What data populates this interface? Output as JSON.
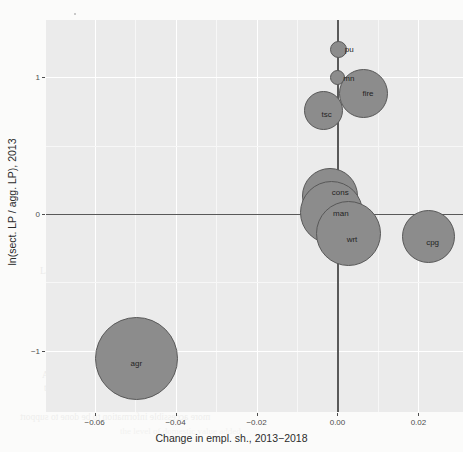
{
  "figure": {
    "background_color": "#fbfbfa",
    "panel_color": "#ebebeb",
    "bubble_fill": "#8c8c8c",
    "bubble_stroke": "#585858",
    "reference_line_color": "#595959"
  },
  "chart_data": {
    "type": "scatter",
    "title": "",
    "subtitle": "",
    "xlabel": "Change in empl. sh., 2013−2018",
    "ylabel": "ln(sect. LP / agg. LP), 2013",
    "xlim": [
      -0.072,
      0.031
    ],
    "ylim": [
      -1.45,
      1.42
    ],
    "xticks": [
      -0.06,
      -0.04,
      -0.02,
      0.0,
      0.02
    ],
    "xticklabels": [
      "−0.06",
      "−0.04",
      "−0.02",
      "0.00",
      "0.02"
    ],
    "yticks": [
      1,
      0,
      -1
    ],
    "yticklabels": [
      "1",
      "0",
      "−1"
    ],
    "grid": true,
    "legend": false,
    "reference_lines": {
      "x": 0,
      "y": 0
    },
    "size_encoding": "employment share",
    "points": [
      {
        "label": "pu",
        "x": 0.0002,
        "y": 1.205,
        "size_px": 8.5,
        "label_dx": 11,
        "label_dy": 0
      },
      {
        "label": "mn",
        "x": 0.0001,
        "y": 1.0,
        "size_px": 7.5,
        "label_dx": 11,
        "label_dy": 1
      },
      {
        "label": "fire",
        "x": 0.0063,
        "y": 0.885,
        "size_px": 24.5,
        "label_dx": 5,
        "label_dy": 0
      },
      {
        "label": "tsc",
        "x": -0.0034,
        "y": 0.76,
        "size_px": 19.5,
        "label_dx": 3,
        "label_dy": 4
      },
      {
        "label": "cons",
        "x": -0.0018,
        "y": 0.135,
        "size_px": 28.0,
        "label_dx": 10,
        "label_dy": -4
      },
      {
        "label": "man",
        "x": -0.0014,
        "y": 0.01,
        "size_px": 31.5,
        "label_dx": 9,
        "label_dy": 0
      },
      {
        "label": "wrt",
        "x": 0.0026,
        "y": -0.14,
        "size_px": 32.5,
        "label_dx": 4,
        "label_dy": 6
      },
      {
        "label": "cpg",
        "x": 0.0225,
        "y": -0.165,
        "size_px": 26.5,
        "label_dx": 4,
        "label_dy": 6
      },
      {
        "label": "agr",
        "x": -0.0497,
        "y": -1.06,
        "size_px": 41.5,
        "label_dx": 0,
        "label_dy": 4
      }
    ]
  },
  "background_text": [
    {
      "text": "1.5.2 Economic Winds and Policy",
      "x": 88,
      "y": 206,
      "size": 9.5,
      "opacity": 0.3,
      "flip": false
    },
    {
      "text": "Sectoral Change Without Policy",
      "x": 132,
      "y": 214,
      "size": 9.0,
      "opacity": 0.22,
      "flip": true
    },
    {
      "text": "better in industry: Germany was a stark case in point for",
      "x": 66,
      "y": 252,
      "size": 9.5,
      "opacity": 0.32,
      "flip": false
    },
    {
      "text": "Labor reallocation: Figure 1.10 further",
      "x": 40,
      "y": 266,
      "size": 9.5,
      "opacity": 0.3,
      "flip": false
    },
    {
      "text": "1.6. Structural Change and Sophistication",
      "x": 118,
      "y": 315,
      "size": 12.5,
      "opacity": 0.34,
      "flip": false
    },
    {
      "text": "of Tradable Exports",
      "x": 148,
      "y": 338,
      "size": 12.5,
      "opacity": 0.34,
      "flip": false
    },
    {
      "text": "As we discuss above, structural change in middle-income",
      "x": 42,
      "y": 370,
      "size": 9.5,
      "opacity": 0.28,
      "flip": false
    },
    {
      "text": "the image of capital is expected that in an input-output",
      "x": 44,
      "y": 383,
      "size": 9.5,
      "opacity": 0.26,
      "flip": false
    },
    {
      "text": "the sector will be shifted to the consumer industries in",
      "x": 46,
      "y": 396,
      "size": 9.5,
      "opacity": 0.24,
      "flip": false
    },
    {
      "text": "more accessible information to be done to support",
      "x": 20,
      "y": 412,
      "size": 9.5,
      "opacity": 0.26,
      "flip": true
    },
    {
      "text": "the level of domestic value added",
      "x": 120,
      "y": 426,
      "size": 9.0,
      "opacity": 0.18,
      "flip": false
    }
  ]
}
